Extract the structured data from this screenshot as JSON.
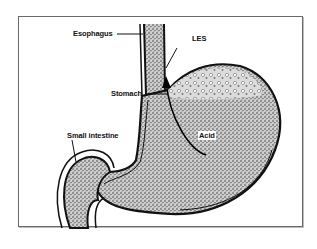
{
  "diagram": {
    "labels": {
      "esophagus": "Esophagus",
      "les": "LES",
      "stomach": "Stomach",
      "small_intestine": "Small intestine",
      "acid": "Acid"
    },
    "colors": {
      "outline": "#111111",
      "fill_stipple": "#555555",
      "background": "#ffffff",
      "frame": "#6a6a6a"
    }
  }
}
